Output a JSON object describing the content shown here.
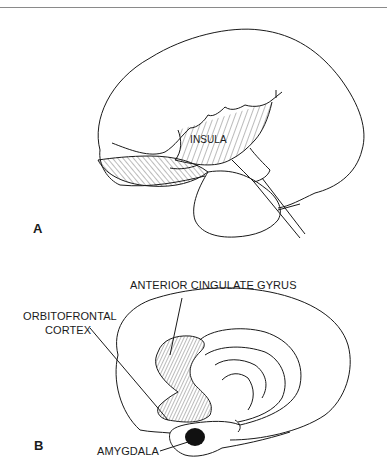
{
  "figure": {
    "panels": [
      {
        "id": "A",
        "letter": "A",
        "view": "lateral",
        "labels": {
          "insula": "INSULA"
        }
      },
      {
        "id": "B",
        "letter": "B",
        "view": "medial",
        "labels": {
          "anterior_cingulate": "ANTERIOR CINGULATE GYRUS",
          "orbitofrontal_line1": "ORBITOFRONTAL",
          "orbitofrontal_line2": "CORTEX",
          "amygdala": "AMYGDALA"
        }
      }
    ],
    "colors": {
      "ink": "#1a1a1a",
      "rule": "#8a8a8a",
      "background": "#ffffff"
    }
  }
}
